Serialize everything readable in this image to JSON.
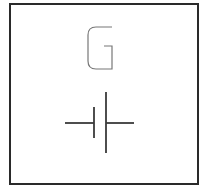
{
  "diagram": {
    "type": "schematic-symbol",
    "symbol": "battery-cell",
    "label": "G",
    "colors": {
      "border": "#2a2a2a",
      "label": "#777777",
      "symbol": "#3a3a3a",
      "background": "#ffffff"
    }
  }
}
